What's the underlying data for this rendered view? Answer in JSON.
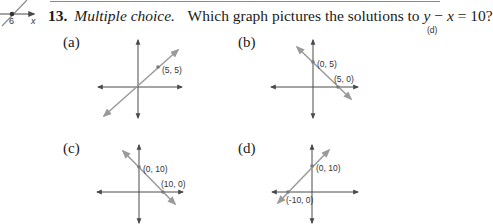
{
  "fragment": {
    "tick_label": "6",
    "axis_label": "x"
  },
  "question": {
    "number": "13.",
    "type": "Multiple choice.",
    "prompt": "Which graph pictures the solutions to",
    "equation_y": "y",
    "equation_minus": " − ",
    "equation_x": "x",
    "equation_rest": " = 10?",
    "answer": "(d)"
  },
  "choices": [
    {
      "label": "(a)",
      "points": [
        {
          "text": "(5, 5)"
        }
      ]
    },
    {
      "label": "(b)",
      "points": [
        {
          "text": "(0, 5)"
        },
        {
          "text": "(5, 0)"
        }
      ]
    },
    {
      "label": "(c)",
      "points": [
        {
          "text": "(0, 10)"
        },
        {
          "text": "(10, 0)"
        }
      ]
    },
    {
      "label": "(d)",
      "points": [
        {
          "text": "(0, 10)"
        },
        {
          "text": "(-10, 0)"
        }
      ]
    }
  ],
  "colors": {
    "axis": "#4a4a4a",
    "line": "#9a9a9a",
    "point": "#7a7a7a"
  }
}
